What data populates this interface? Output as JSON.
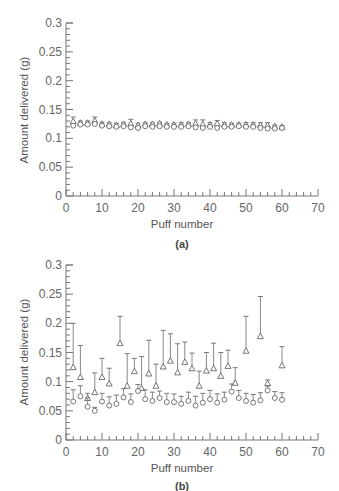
{
  "header": {
    "cut_text": "— ——— —— ——— —— —— —"
  },
  "chart_data": [
    {
      "type": "scatter",
      "panel_label": "(a)",
      "xlabel": "Puff number",
      "ylabel": "Amount delivered (g)",
      "xlim": [
        0,
        70
      ],
      "ylim": [
        0,
        0.3
      ],
      "xticks": [
        0,
        10,
        20,
        30,
        40,
        50,
        60,
        70
      ],
      "yticks": [
        0,
        0.05,
        0.1,
        0.15,
        0.2,
        0.25,
        0.3
      ],
      "ytick_labels": [
        "0",
        "0.05",
        "0.1",
        "0.15",
        "0.2",
        "0.25",
        "0.3"
      ],
      "grid": false,
      "series": [
        {
          "name": "triangles",
          "marker": "triangle",
          "x": [
            2,
            4,
            6,
            8,
            10,
            12,
            14,
            16,
            18,
            20,
            22,
            24,
            26,
            28,
            30,
            32,
            34,
            36,
            38,
            40,
            42,
            44,
            46,
            48,
            50,
            52,
            54,
            56,
            58,
            60
          ],
          "y": [
            0.13,
            0.127,
            0.127,
            0.131,
            0.125,
            0.125,
            0.123,
            0.125,
            0.126,
            0.123,
            0.125,
            0.125,
            0.126,
            0.124,
            0.124,
            0.124,
            0.125,
            0.126,
            0.125,
            0.124,
            0.126,
            0.124,
            0.124,
            0.124,
            0.124,
            0.124,
            0.123,
            0.123,
            0.121,
            0.12
          ],
          "err_high": [
            0.137,
            0.13,
            0.13,
            0.137,
            0.128,
            0.127,
            0.126,
            0.127,
            0.133,
            0.126,
            0.127,
            0.127,
            0.128,
            0.126,
            0.126,
            0.127,
            0.127,
            0.132,
            0.132,
            0.127,
            0.131,
            0.127,
            0.126,
            0.126,
            0.127,
            0.127,
            0.127,
            0.127,
            0.123,
            0.122
          ]
        },
        {
          "name": "circles",
          "marker": "circle",
          "x": [
            2,
            4,
            6,
            8,
            10,
            12,
            14,
            16,
            18,
            20,
            22,
            24,
            26,
            28,
            30,
            32,
            34,
            36,
            38,
            40,
            42,
            44,
            46,
            48,
            50,
            52,
            54,
            56,
            58,
            60
          ],
          "y": [
            0.122,
            0.124,
            0.124,
            0.125,
            0.122,
            0.121,
            0.12,
            0.121,
            0.119,
            0.118,
            0.121,
            0.12,
            0.121,
            0.12,
            0.12,
            0.12,
            0.121,
            0.119,
            0.118,
            0.12,
            0.118,
            0.12,
            0.12,
            0.121,
            0.12,
            0.12,
            0.118,
            0.117,
            0.117,
            0.118
          ]
        }
      ]
    },
    {
      "type": "scatter",
      "panel_label": "(b)",
      "xlabel": "Puff number",
      "ylabel": "Amount delivered (g)",
      "xlim": [
        0,
        70
      ],
      "ylim": [
        0,
        0.3
      ],
      "xticks": [
        0,
        10,
        20,
        30,
        40,
        50,
        60,
        70
      ],
      "yticks": [
        0,
        0.05,
        0.1,
        0.15,
        0.2,
        0.25,
        0.3
      ],
      "ytick_labels": [
        "0",
        "0.05",
        "0.1",
        "0.15",
        "0.2",
        "0.25",
        "0.3"
      ],
      "grid": false,
      "series": [
        {
          "name": "triangles",
          "marker": "triangle",
          "x": [
            2,
            4,
            6,
            8,
            10,
            12,
            15,
            17,
            19,
            21,
            23,
            25,
            27,
            29,
            31,
            33,
            35,
            37,
            39,
            41,
            43,
            45,
            47,
            50,
            54,
            56,
            60
          ],
          "y": [
            0.125,
            0.108,
            0.072,
            0.082,
            0.108,
            0.097,
            0.166,
            0.093,
            0.118,
            0.089,
            0.114,
            0.093,
            0.126,
            0.136,
            0.116,
            0.134,
            0.123,
            0.093,
            0.119,
            0.123,
            0.11,
            0.127,
            0.098,
            0.153,
            0.178,
            0.097,
            0.128
          ],
          "err_high": [
            0.2,
            0.162,
            0.08,
            0.115,
            0.14,
            0.123,
            0.212,
            0.148,
            0.14,
            0.143,
            0.171,
            0.13,
            0.188,
            0.182,
            0.165,
            0.168,
            0.149,
            0.118,
            0.15,
            0.166,
            0.15,
            0.154,
            0.124,
            0.212,
            0.246,
            0.103,
            0.16
          ]
        },
        {
          "name": "circles",
          "marker": "circle",
          "x": [
            2,
            4,
            6,
            8,
            10,
            12,
            14,
            16,
            18,
            20,
            22,
            24,
            26,
            28,
            30,
            32,
            34,
            36,
            38,
            40,
            42,
            44,
            46,
            48,
            50,
            52,
            54,
            56,
            58,
            60
          ],
          "y": [
            0.066,
            0.075,
            0.057,
            0.05,
            0.066,
            0.059,
            0.062,
            0.073,
            0.065,
            0.084,
            0.07,
            0.067,
            0.072,
            0.065,
            0.065,
            0.062,
            0.067,
            0.059,
            0.064,
            0.07,
            0.064,
            0.069,
            0.083,
            0.072,
            0.067,
            0.064,
            0.068,
            0.085,
            0.072,
            0.069
          ],
          "err_high": [
            0.086,
            0.093,
            0.072,
            0.056,
            0.08,
            0.074,
            0.077,
            0.088,
            0.079,
            0.095,
            0.086,
            0.082,
            0.084,
            0.08,
            0.079,
            0.075,
            0.082,
            0.075,
            0.08,
            0.085,
            0.079,
            0.082,
            0.096,
            0.085,
            0.08,
            0.078,
            0.081,
            0.093,
            0.083,
            0.081
          ]
        }
      ]
    }
  ]
}
